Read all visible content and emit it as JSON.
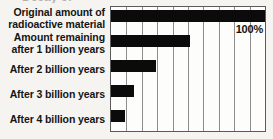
{
  "chart_data": {
    "type": "bar",
    "title": "",
    "orientation": "horizontal",
    "xlabel": "",
    "ylabel": "",
    "xlim": [
      0,
      100
    ],
    "grid": true,
    "gridline_count": 9,
    "legend": "none",
    "categories": [
      "Original amount of\nradioactive material",
      "Amount remaining\nafter 1 billion years",
      "After 2 billion years",
      "After 3 billion years",
      "After 4 billion years"
    ],
    "values": [
      100,
      51,
      29,
      15,
      9
    ],
    "annotations": [
      {
        "text": "100%",
        "for_category": "Original amount of radioactive material"
      }
    ],
    "colors": {
      "bar": "#0b0b0b",
      "plot_background": "#fdfdfc",
      "page_background": "#f6f4f1",
      "frame": "#5a5a5a",
      "gridline": "#8d8d8d",
      "text": "#141414"
    }
  },
  "title_sliver": {
    "text": "Decay of"
  }
}
